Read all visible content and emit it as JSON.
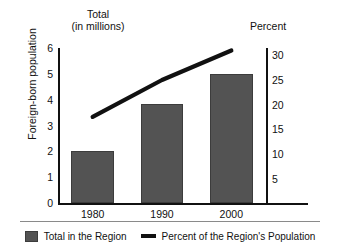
{
  "chart_data": {
    "type": "bar",
    "title": "",
    "categories": [
      "1980",
      "1990",
      "2000"
    ],
    "series": [
      {
        "name": "Total in the Region",
        "type": "bar",
        "axis": "left",
        "unit": "millions",
        "values": [
          2.0,
          3.85,
          5.0
        ],
        "color": "#535353"
      },
      {
        "name": "Percent of the Region's Population",
        "type": "line",
        "axis": "right",
        "unit": "percent",
        "values": [
          17.5,
          25.0,
          31.0
        ],
        "color": "#111111"
      }
    ],
    "left_axis": {
      "title": "Foreign-born population",
      "header": "Total\n(in millions)",
      "ticks": [
        "6",
        "5",
        "4",
        "3",
        "2",
        "1",
        "0"
      ],
      "tick_values": [
        6,
        5,
        4,
        3,
        2,
        1,
        0
      ],
      "ylim": [
        0,
        6
      ]
    },
    "right_axis": {
      "title": "Percent",
      "ticks": [
        "30",
        "25",
        "20",
        "15",
        "10",
        "5"
      ],
      "tick_values": [
        30,
        25,
        20,
        15,
        10,
        5
      ],
      "ylim": [
        0,
        31.5
      ]
    },
    "xlabel": "",
    "grid": false,
    "legend_position": "bottom",
    "legend": [
      {
        "label": "Total in the Region",
        "marker": "box",
        "color": "#535353"
      },
      {
        "label": "Percent of the Region's Population",
        "marker": "line",
        "color": "#111111"
      }
    ]
  }
}
